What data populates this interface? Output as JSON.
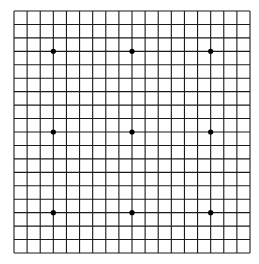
{
  "board": {
    "size": 19,
    "origin": {
      "x": 14,
      "y": 11
    },
    "extent": {
      "width": 236,
      "height": 242
    },
    "line_color": "#1a1a1a",
    "background": "#ffffff",
    "star_color": "#000000",
    "star_points": [
      [
        3,
        3
      ],
      [
        9,
        3
      ],
      [
        15,
        3
      ],
      [
        3,
        9
      ],
      [
        9,
        9
      ],
      [
        15,
        9
      ],
      [
        3,
        15
      ],
      [
        9,
        15
      ],
      [
        15,
        15
      ]
    ],
    "stones": []
  }
}
